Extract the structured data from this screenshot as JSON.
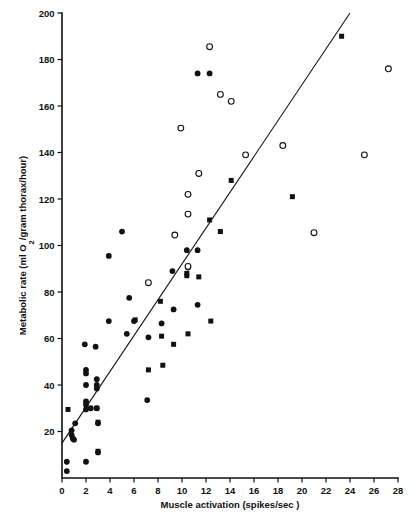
{
  "chart_data": {
    "type": "scatter",
    "title": "",
    "xlabel": "Muscle activation (spikes/sec )",
    "ylabel": "Metabolic rate (ml O2/gram thorax/hour)",
    "ylabel_parts": {
      "before": "Metabolic rate (ml O",
      "sub": "2",
      "after": "/gram thorax/hour)"
    },
    "xlim": [
      0,
      28
    ],
    "ylim": [
      0,
      200
    ],
    "xticks": [
      0,
      2,
      4,
      6,
      8,
      10,
      12,
      14,
      16,
      18,
      20,
      22,
      24,
      26,
      28
    ],
    "yticks": [
      20,
      40,
      60,
      80,
      100,
      120,
      140,
      160,
      180,
      200
    ],
    "xtick_labels": [
      "0",
      "2",
      "4",
      "6",
      "8",
      "10",
      "12",
      "14",
      "16",
      "18",
      "20",
      "22",
      "24",
      "26",
      "28"
    ],
    "ytick_labels": [
      "20",
      "40",
      "60",
      "80",
      "100",
      "120",
      "140",
      "160",
      "180",
      "200"
    ],
    "grid": false,
    "legend": false,
    "legend_position": "none",
    "marker_color": "#111111",
    "line_color": "#111111",
    "trend_line": {
      "label": "regression-line",
      "x1": 0.0,
      "y1": 15.0,
      "x2": 24.0,
      "y2": 200.0,
      "slope": 7.71,
      "intercept": 15.0
    },
    "series": [
      {
        "name": "filled-circle",
        "marker": "filled-circle",
        "points": [
          [
            0.4,
            7.0
          ],
          [
            0.4,
            3.0
          ],
          [
            0.8,
            20.5
          ],
          [
            0.8,
            18.5
          ],
          [
            0.9,
            17.0
          ],
          [
            1.0,
            16.5
          ],
          [
            1.1,
            23.5
          ],
          [
            1.9,
            57.5
          ],
          [
            2.0,
            46.5
          ],
          [
            2.0,
            45.0
          ],
          [
            2.0,
            40.0
          ],
          [
            2.0,
            33.0
          ],
          [
            2.0,
            31.5
          ],
          [
            2.0,
            29.5
          ],
          [
            2.0,
            7.0
          ],
          [
            2.4,
            30.0
          ],
          [
            2.8,
            56.5
          ],
          [
            2.9,
            42.5
          ],
          [
            2.9,
            40.0
          ],
          [
            2.9,
            38.5
          ],
          [
            2.9,
            30.0
          ],
          [
            3.0,
            23.5
          ],
          [
            3.0,
            11.0
          ],
          [
            3.9,
            95.5
          ],
          [
            3.9,
            67.5
          ],
          [
            5.0,
            106.0
          ],
          [
            5.4,
            62.0
          ],
          [
            5.6,
            77.5
          ],
          [
            6.0,
            67.5
          ],
          [
            7.1,
            33.5
          ],
          [
            7.2,
            60.5
          ],
          [
            8.3,
            66.5
          ],
          [
            9.2,
            89.0
          ],
          [
            9.3,
            72.5
          ],
          [
            10.4,
            98.0
          ],
          [
            10.5,
            90.5
          ],
          [
            11.3,
            98.0
          ],
          [
            11.3,
            74.5
          ]
        ]
      },
      {
        "name": "filled-square",
        "marker": "filled-square",
        "points": [
          [
            0.5,
            29.5
          ],
          [
            2.9,
            30.0
          ],
          [
            3.0,
            24.0
          ],
          [
            3.0,
            11.5
          ],
          [
            6.1,
            68.0
          ],
          [
            7.2,
            46.5
          ],
          [
            8.2,
            76.0
          ],
          [
            8.3,
            61.0
          ],
          [
            8.4,
            48.5
          ],
          [
            9.3,
            57.5
          ],
          [
            10.4,
            88.0
          ],
          [
            10.4,
            87.0
          ],
          [
            10.5,
            62.0
          ],
          [
            11.4,
            86.5
          ],
          [
            12.3,
            111.0
          ],
          [
            12.4,
            67.5
          ],
          [
            13.2,
            106.0
          ],
          [
            14.1,
            128.0
          ],
          [
            19.2,
            121.0
          ],
          [
            23.3,
            190.0
          ]
        ]
      },
      {
        "name": "open-circle",
        "marker": "open-circle",
        "points": [
          [
            7.2,
            84.0
          ],
          [
            9.4,
            104.5
          ],
          [
            9.9,
            150.5
          ],
          [
            10.5,
            113.5
          ],
          [
            10.5,
            122.0
          ],
          [
            10.5,
            91.0
          ],
          [
            11.4,
            131.0
          ],
          [
            12.3,
            185.5
          ],
          [
            13.2,
            165.0
          ],
          [
            14.1,
            162.0
          ],
          [
            15.3,
            139.0
          ],
          [
            18.4,
            143.0
          ],
          [
            21.0,
            105.5
          ],
          [
            25.2,
            139.0
          ],
          [
            27.2,
            176.0
          ]
        ]
      },
      {
        "name": "filled-circle-high",
        "marker": "filled-circle",
        "points": [
          [
            11.3,
            174.0
          ],
          [
            12.3,
            174.0
          ]
        ]
      }
    ]
  }
}
